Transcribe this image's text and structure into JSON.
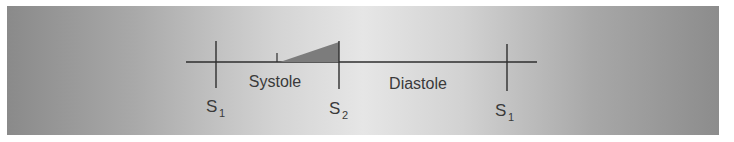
{
  "diagram": {
    "phases": [
      {
        "label": "Systole"
      },
      {
        "label": "Diastole"
      }
    ],
    "markers": [
      {
        "label": "S",
        "sub": "1"
      },
      {
        "label": "S",
        "sub": "2"
      },
      {
        "label": "S",
        "sub": "1"
      }
    ],
    "colors": {
      "line": "#2e2e2e",
      "murmur_fill": "#7c7c7c",
      "text": "#3a3a3a"
    },
    "murmur_shape": "crescendo-triangle"
  }
}
